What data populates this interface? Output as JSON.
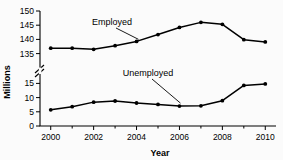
{
  "chart_data": {
    "type": "line",
    "title": "",
    "xlabel": "Year",
    "ylabel": "Millions",
    "x": [
      2000,
      2001,
      2002,
      2003,
      2004,
      2005,
      2006,
      2007,
      2008,
      2009,
      2010
    ],
    "xtick_labels": [
      "2000",
      "2002",
      "2004",
      "2006",
      "2008",
      "2010"
    ],
    "xtick_values": [
      2000,
      2002,
      2004,
      2006,
      2008,
      2010
    ],
    "xminor_values": [
      2001,
      2003,
      2005,
      2007,
      2009
    ],
    "xlim": [
      1999.5,
      2010.5
    ],
    "ytick_labels": [
      "0",
      "5",
      "10",
      "15",
      "135",
      "140",
      "145",
      "150"
    ],
    "ytick_values": [
      0,
      5,
      10,
      15,
      135,
      140,
      145,
      150
    ],
    "y_axis_break": true,
    "y_axis_break_between": [
      15,
      135
    ],
    "grid": false,
    "legend_position": "inline-annotation",
    "series": [
      {
        "name": "Employed",
        "label": "Employed",
        "values": [
          136.9,
          136.9,
          136.5,
          137.8,
          139.3,
          141.7,
          144.2,
          146.0,
          145.3,
          139.9,
          139.1
        ]
      },
      {
        "name": "Unemployed",
        "label": "Unemployed",
        "values": [
          5.7,
          6.8,
          8.4,
          8.8,
          8.1,
          7.6,
          7.0,
          7.1,
          8.9,
          14.3,
          14.8
        ]
      }
    ],
    "annotations": [
      {
        "text": "Employed",
        "target_year": 2004,
        "target_value": 139.3
      },
      {
        "text": "Unemployed",
        "target_year": 2006,
        "target_value": 7.0
      }
    ]
  }
}
